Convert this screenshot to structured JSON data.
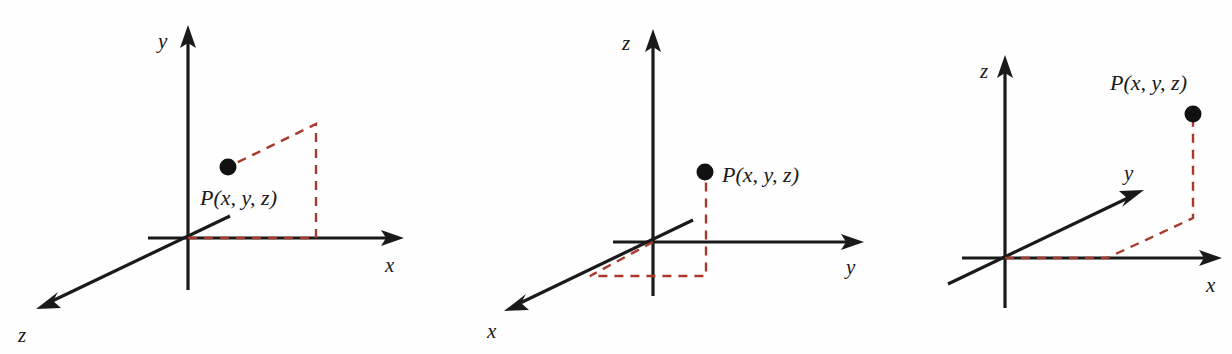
{
  "figure": {
    "background_color": "#fefefe",
    "axis_color": "#1a1a1a",
    "dashed_color": "#a8392b",
    "point_color": "#111111",
    "diagrams": [
      {
        "id": "diagram-1",
        "description": "y-up coordinate system with x to the right and z toward lower left",
        "origin": {
          "x": 188,
          "y": 238
        },
        "axes": [
          {
            "name": "y",
            "label": "y",
            "label_x": 158,
            "label_y": 48,
            "tip_x": 188,
            "tip_y": 28,
            "tail_x": 188,
            "tail_y": 290,
            "arrow": "up"
          },
          {
            "name": "x",
            "label": "x",
            "label_x": 385,
            "label_y": 272,
            "tip_x": 402,
            "tip_y": 238,
            "tail_x": 148,
            "tail_y": 238,
            "arrow": "right"
          },
          {
            "name": "z",
            "label": "z",
            "label_x": 20,
            "label_y": 340,
            "tip_x": 38,
            "tip_y": 308,
            "tail_x": 230,
            "tail_y": 216,
            "arrow": "lower-left"
          }
        ],
        "point": {
          "label": "P(x, y, z)",
          "dot_x": 228,
          "dot_y": 167,
          "label_x": 200,
          "label_y": 205
        },
        "projection_path": [
          {
            "x": 188,
            "y": 238
          },
          {
            "x": 316,
            "y": 238
          },
          {
            "x": 316,
            "y": 124
          },
          {
            "x": 228,
            "y": 167
          }
        ]
      },
      {
        "id": "diagram-2",
        "description": "z-up coordinate system with y to the right and x toward lower left",
        "origin": {
          "x": 653,
          "y": 242
        },
        "axes": [
          {
            "name": "z",
            "label": "z",
            "label_x": 622,
            "label_y": 50,
            "tip_x": 653,
            "tip_y": 32,
            "tail_x": 653,
            "tail_y": 296,
            "arrow": "up"
          },
          {
            "name": "y",
            "label": "y",
            "label_x": 846,
            "label_y": 274,
            "tip_x": 862,
            "tip_y": 242,
            "tail_x": 613,
            "tail_y": 242,
            "arrow": "right"
          },
          {
            "name": "x",
            "label": "x",
            "label_x": 487,
            "label_y": 338,
            "tip_x": 506,
            "tip_y": 310,
            "tail_x": 693,
            "tail_y": 220,
            "arrow": "lower-left"
          }
        ],
        "point": {
          "label": "P(x, y, z)",
          "dot_x": 705,
          "dot_y": 172,
          "label_x": 722,
          "label_y": 182
        },
        "projection_path": [
          {
            "x": 653,
            "y": 242
          },
          {
            "x": 590,
            "y": 276
          },
          {
            "x": 706,
            "y": 276
          },
          {
            "x": 706,
            "y": 172
          }
        ]
      },
      {
        "id": "diagram-3",
        "description": "z-up coordinate system with x to the right and y toward upper right",
        "origin": {
          "x": 1005,
          "y": 258
        },
        "axes": [
          {
            "name": "z",
            "label": "z",
            "label_x": 980,
            "label_y": 78,
            "tip_x": 1005,
            "tip_y": 58,
            "tail_x": 1005,
            "tail_y": 308,
            "arrow": "up"
          },
          {
            "name": "x",
            "label": "x",
            "label_x": 1206,
            "label_y": 292,
            "tip_x": 1220,
            "tip_y": 258,
            "tail_x": 962,
            "tail_y": 258,
            "arrow": "right"
          },
          {
            "name": "y",
            "label": "y",
            "label_x": 1124,
            "label_y": 180,
            "tip_x": 1142,
            "tip_y": 190,
            "tail_x": 948,
            "tail_y": 284,
            "arrow": "upper-right"
          }
        ],
        "point": {
          "label": "P(x, y, z)",
          "dot_x": 1193,
          "dot_y": 114,
          "label_x": 1110,
          "label_y": 90
        },
        "projection_path": [
          {
            "x": 1005,
            "y": 258
          },
          {
            "x": 1107,
            "y": 258
          },
          {
            "x": 1193,
            "y": 218
          },
          {
            "x": 1193,
            "y": 114
          }
        ]
      }
    ]
  }
}
